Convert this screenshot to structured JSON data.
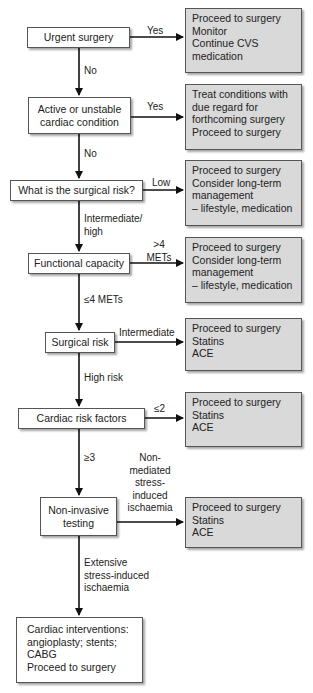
{
  "flowchart": {
    "decisions": [
      {
        "id": "urgent",
        "text": [
          "Urgent surgery"
        ]
      },
      {
        "id": "active",
        "text": [
          "Active or unstable",
          "cardiac condition"
        ]
      },
      {
        "id": "surgical_risk_q",
        "text": [
          "What is the surgical risk?"
        ]
      },
      {
        "id": "functional",
        "text": [
          "Functional capacity"
        ]
      },
      {
        "id": "surgical_risk",
        "text": [
          "Surgical risk"
        ]
      },
      {
        "id": "cardiac_factors",
        "text": [
          "Cardiac risk factors"
        ]
      },
      {
        "id": "noninvasive",
        "text": [
          "Non-invasive",
          "testing"
        ]
      }
    ],
    "outcomes": [
      {
        "id": "o1",
        "text": [
          "Proceed to surgery",
          "Monitor",
          "Continue CVS",
          "medication"
        ]
      },
      {
        "id": "o2",
        "text": [
          "Treat conditions with",
          "due regard for",
          "forthcoming surgery",
          "Proceed to surgery"
        ]
      },
      {
        "id": "o3",
        "text": [
          "Proceed to surgery",
          "Consider long-term",
          "management",
          "– lifestyle, medication"
        ]
      },
      {
        "id": "o4",
        "text": [
          "Proceed to surgery",
          "Consider long-term",
          "management",
          "– lifestyle, medication"
        ]
      },
      {
        "id": "o5",
        "text": [
          "Proceed to surgery",
          "Statins",
          "ACE"
        ]
      },
      {
        "id": "o6",
        "text": [
          "Proceed to surgery",
          "Statins",
          "ACE"
        ]
      },
      {
        "id": "o7",
        "text": [
          "Proceed to surgery",
          "Statins",
          "ACE"
        ]
      }
    ],
    "final": {
      "text": [
        "Cardiac interventions:",
        "angioplasty; stents;",
        "CABG",
        "Proceed to surgery"
      ]
    },
    "edge_labels": {
      "yes1": "Yes",
      "no1": "No",
      "yes2": "Yes",
      "no2": "No",
      "low": "Low",
      "intermediate_high": [
        "Intermediate/",
        "high"
      ],
      "gt4": [
        ">4",
        "METs"
      ],
      "le4": "≤4 METs",
      "intermediate": "Intermediate",
      "high_risk": "High risk",
      "le2": "≤2",
      "ge3": "≥3",
      "non_mediated": [
        "Non-",
        "mediated",
        "stress-",
        "induced",
        "ischaemia"
      ],
      "extensive": [
        "Extensive",
        "stress-induced",
        "ischaemia"
      ]
    },
    "colors": {
      "outcome_fill": "#d9d9d9",
      "decision_fill": "#ffffff",
      "border": "#555555",
      "arrow": "#111111"
    }
  }
}
